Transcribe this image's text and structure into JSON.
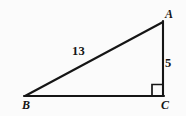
{
  "figure": {
    "kind": "right-triangle-diagram",
    "background_color": "#fbfbfb",
    "stroke_color": "#151515",
    "text_color": "#151515",
    "vertices": {
      "A": {
        "label": "A",
        "x": 163,
        "y": 22
      },
      "B": {
        "label": "B",
        "x": 25,
        "y": 96
      },
      "C": {
        "label": "C",
        "x": 163,
        "y": 96
      }
    },
    "sides": [
      {
        "name": "hypotenuse",
        "from": "B",
        "to": "A",
        "length_label": "13"
      },
      {
        "name": "vertical-leg",
        "from": "A",
        "to": "C",
        "length_label": "5"
      },
      {
        "name": "horizontal-leg",
        "from": "B",
        "to": "C",
        "length_label": ""
      }
    ],
    "right_angle": {
      "at_vertex": "C",
      "marker": "square",
      "size": 11
    },
    "labels": {
      "vertex_a": "A",
      "vertex_b": "B",
      "vertex_c": "C",
      "hypotenuse_length": "13",
      "vertical_leg_length": "5"
    }
  }
}
